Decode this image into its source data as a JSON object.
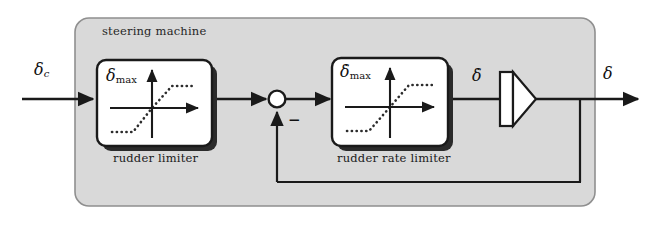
{
  "figure": {
    "kind": "control-system-block-diagram",
    "title": "steering machine",
    "background_color": "#ffffff",
    "panel_fill": "#d9d9d9",
    "panel_stroke": "#8a8a8a",
    "line_color": "#1a1a1a",
    "block_fill": "#ffffff",
    "block_stroke": "#1a1a1a",
    "shadow_color": "#2b2b2b"
  },
  "panel": {
    "label": "steering machine"
  },
  "signals": {
    "input": {
      "name": "delta-commanded",
      "base": "δ",
      "subscript": "c",
      "text": "δc"
    },
    "rate": {
      "name": "delta-dot",
      "base": "δ̇",
      "text": "δ̇"
    },
    "output": {
      "name": "delta",
      "base": "δ",
      "text": "δ"
    }
  },
  "blocks": [
    {
      "id": "rudder-limiter",
      "caption": "rudder limiter",
      "inner_label_base": "δ",
      "inner_label_sub": "max",
      "inner_label_text": "δmax",
      "characteristic": "saturation",
      "curve_style": "dotted"
    },
    {
      "id": "rudder-rate-limiter",
      "caption": "rudder rate limiter",
      "inner_label_base": "δ̇",
      "inner_label_sub": "max",
      "inner_label_text": "δ̇max",
      "characteristic": "saturation",
      "curve_style": "dotted"
    }
  ],
  "summing_junction": {
    "name": "summing-junction",
    "fill": "#ffffff",
    "feedback_sign": "−",
    "feedback_sign_label": "minus"
  },
  "integrator": {
    "name": "integrator",
    "symbol": "triangle-with-bar",
    "fill": "#ffffff"
  },
  "feedback": {
    "name": "rudder-feedback-path",
    "description": "output fed back to summing junction"
  }
}
